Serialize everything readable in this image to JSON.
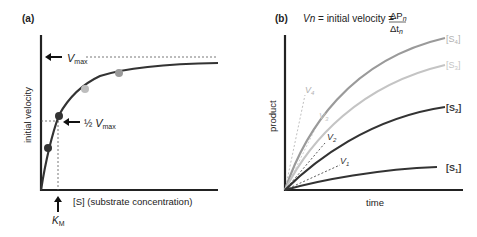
{
  "panels": {
    "a": {
      "label": "(a)",
      "ylabel": "initial velocity",
      "xlabel": "[S] (substrate concentration)",
      "vmax_label": "V",
      "vmax_sub": "max",
      "half_vmax_prefix": "½ ",
      "half_vmax_label": "V",
      "half_vmax_sub": "max",
      "km_label": "K",
      "km_sub": "M"
    },
    "b": {
      "label": "(b)",
      "formula_lhs": "Vn",
      "formula_mid": " = initial velocity = ",
      "formula_num": "ΔP",
      "formula_num_sub": "n",
      "formula_den": "Δt",
      "formula_den_sub": "n",
      "ylabel": "product",
      "xlabel": "time",
      "curves": [
        {
          "name": "S",
          "sub": "4",
          "slope_label": "V",
          "slope_sub": "4"
        },
        {
          "name": "S",
          "sub": "3",
          "slope_label": "V",
          "slope_sub": "3"
        },
        {
          "name": "S",
          "sub": "2",
          "slope_label": "V",
          "slope_sub": "2"
        },
        {
          "name": "S",
          "sub": "1",
          "slope_label": "V",
          "slope_sub": "1"
        }
      ]
    }
  },
  "colors": {
    "dark": "#333333",
    "mid": "#9a9a9a",
    "light": "#bdbdbd",
    "axis": "#222222"
  }
}
